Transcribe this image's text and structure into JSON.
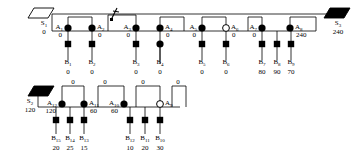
{
  "diagram": {
    "type": "network-tree",
    "colors": {
      "line": "#000000",
      "filled": "#000000",
      "open": "#ffffff",
      "background": "#ffffff"
    },
    "sources": [
      {
        "id": "S1",
        "label": "S",
        "sub": "1",
        "value": "0",
        "shape": "parallelogram-open",
        "x": 44,
        "y": 14
      },
      {
        "id": "S2",
        "label": "S",
        "sub": "2",
        "value": "120",
        "shape": "parallelogram-filled",
        "x": 30,
        "y": 92
      },
      {
        "id": "S3",
        "label": "S",
        "sub": "3",
        "value": "240",
        "shape": "parallelogram-filled",
        "x": 338,
        "y": 14
      }
    ],
    "level_a": [
      {
        "id": "A1",
        "label": "A",
        "sub": "1",
        "value": "0",
        "shape": "circle-filled",
        "x": 68,
        "y": 28,
        "labelSide": "left"
      },
      {
        "id": "A2",
        "label": "A",
        "sub": "2",
        "value": "0",
        "shape": "circle-filled",
        "x": 92,
        "y": 28,
        "labelSide": "right"
      },
      {
        "id": "A3",
        "label": "A",
        "sub": "3",
        "value": "0",
        "shape": "circle-filled",
        "x": 136,
        "y": 28,
        "labelSide": "left"
      },
      {
        "id": "A4",
        "label": "A",
        "sub": "4",
        "value": "0",
        "shape": "circle-filled",
        "x": 160,
        "y": 28,
        "labelSide": "right"
      },
      {
        "id": "A5",
        "label": "A",
        "sub": "5",
        "value": "0",
        "shape": "circle-filled",
        "x": 202,
        "y": 28,
        "labelSide": "left"
      },
      {
        "id": "A6",
        "label": "A",
        "sub": "6",
        "value": "0",
        "shape": "circle-open",
        "x": 226,
        "y": 28,
        "labelSide": "right"
      },
      {
        "id": "A7",
        "label": "A",
        "sub": "7",
        "value": "0",
        "shape": "circle-filled",
        "x": 262,
        "y": 28,
        "labelSide": "left"
      },
      {
        "id": "A8",
        "label": "A",
        "sub": "8",
        "value": "240",
        "shape": "circle-filled",
        "x": 290,
        "y": 28,
        "labelSide": "right"
      },
      {
        "id": "A9",
        "label": "A",
        "sub": "9",
        "value": "",
        "shape": "circle-open",
        "x": 160,
        "y": 104,
        "labelSide": "right"
      },
      {
        "id": "A10",
        "label": "A",
        "sub": "10",
        "value": "60",
        "shape": "circle-filled",
        "x": 124,
        "y": 104,
        "labelSide": "left"
      },
      {
        "id": "A11",
        "label": "A",
        "sub": "11",
        "value": "60",
        "shape": "circle-filled",
        "x": 84,
        "y": 104,
        "labelSide": "right"
      },
      {
        "id": "A12",
        "label": "A",
        "sub": "12",
        "value": "120",
        "shape": "circle-filled",
        "x": 62,
        "y": 104,
        "labelSide": "left"
      }
    ],
    "level_b": [
      {
        "id": "B1",
        "label": "B",
        "sub": "1",
        "value": "0",
        "shape": "square",
        "x": 68,
        "y": 44
      },
      {
        "id": "B2",
        "label": "B",
        "sub": "2",
        "value": "0",
        "shape": "square",
        "x": 92,
        "y": 44
      },
      {
        "id": "B3",
        "label": "B",
        "sub": "3",
        "value": "0",
        "shape": "square",
        "x": 136,
        "y": 44
      },
      {
        "id": "B4",
        "label": "B",
        "sub": "4",
        "value": "0",
        "shape": "circle-filled",
        "x": 160,
        "y": 44
      },
      {
        "id": "B5",
        "label": "B",
        "sub": "5",
        "value": "0",
        "shape": "square",
        "x": 202,
        "y": 44
      },
      {
        "id": "B6",
        "label": "B",
        "sub": "6",
        "value": "0",
        "shape": "square",
        "x": 226,
        "y": 44
      },
      {
        "id": "B7",
        "label": "B",
        "sub": "7",
        "value": "80",
        "shape": "square",
        "x": 262,
        "y": 44
      },
      {
        "id": "B8",
        "label": "B",
        "sub": "8",
        "value": "90",
        "shape": "square",
        "x": 277,
        "y": 44
      },
      {
        "id": "B9",
        "label": "B",
        "sub": "9",
        "value": "70",
        "shape": "square",
        "x": 291,
        "y": 44
      },
      {
        "id": "B10",
        "label": "B",
        "sub": "10",
        "value": "30",
        "shape": "square",
        "x": 160,
        "y": 120
      },
      {
        "id": "B11",
        "label": "B",
        "sub": "11",
        "value": "20",
        "shape": "square",
        "x": 145,
        "y": 120
      },
      {
        "id": "B12",
        "label": "B",
        "sub": "12",
        "value": "10",
        "shape": "square",
        "x": 130,
        "y": 120
      },
      {
        "id": "B13",
        "label": "B",
        "sub": "13",
        "value": "15",
        "shape": "square",
        "x": 84,
        "y": 120
      },
      {
        "id": "B14",
        "label": "B",
        "sub": "14",
        "value": "25",
        "shape": "square",
        "x": 70,
        "y": 120
      },
      {
        "id": "B15",
        "label": "B",
        "sub": "15",
        "value": "20",
        "shape": "square",
        "x": 56,
        "y": 120
      }
    ],
    "arch_labels": [
      {
        "text": "0",
        "x": 73,
        "y": 78
      },
      {
        "text": "0",
        "x": 105,
        "y": 78
      },
      {
        "text": "0",
        "x": 143,
        "y": 78
      },
      {
        "text": "0",
        "x": 178,
        "y": 78
      }
    ],
    "break_marker": {
      "name": "break-slash-marker",
      "x": 114,
      "y": 12
    }
  }
}
